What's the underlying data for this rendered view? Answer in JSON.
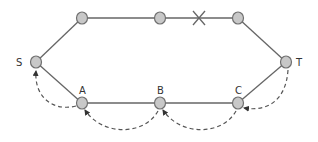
{
  "diagram": {
    "type": "network-path",
    "colors": {
      "edge": "#666666",
      "node_fill": "#c8c8c8",
      "node_stroke": "#707070",
      "dashed": "#555555",
      "label": "#333333"
    },
    "nodes": [
      {
        "id": "S",
        "label": "S",
        "x": 36,
        "y": 62
      },
      {
        "id": "U1",
        "label": "",
        "x": 82,
        "y": 18
      },
      {
        "id": "U2",
        "label": "",
        "x": 160,
        "y": 18
      },
      {
        "id": "U3",
        "label": "",
        "x": 238,
        "y": 18
      },
      {
        "id": "T",
        "label": "T",
        "x": 286,
        "y": 62
      },
      {
        "id": "A",
        "label": "A",
        "x": 82,
        "y": 103
      },
      {
        "id": "B",
        "label": "B",
        "x": 160,
        "y": 103
      },
      {
        "id": "C",
        "label": "C",
        "x": 238,
        "y": 103
      }
    ],
    "edges": [
      {
        "from": "S",
        "to": "U1"
      },
      {
        "from": "U1",
        "to": "U2"
      },
      {
        "from": "U2",
        "to": "U3",
        "broken": true,
        "break_mark": "X"
      },
      {
        "from": "U3",
        "to": "T"
      },
      {
        "from": "S",
        "to": "A"
      },
      {
        "from": "A",
        "to": "B"
      },
      {
        "from": "B",
        "to": "C"
      },
      {
        "from": "C",
        "to": "T"
      }
    ],
    "dashed_arrows": [
      {
        "from": "T",
        "to": "C"
      },
      {
        "from": "C",
        "to": "B"
      },
      {
        "from": "B",
        "to": "A"
      },
      {
        "from": "A",
        "to": "S"
      }
    ]
  }
}
